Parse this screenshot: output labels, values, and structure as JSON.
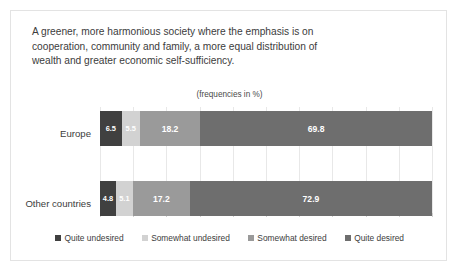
{
  "card": {
    "title_lines": [
      "A greener, more harmonious society where the emphasis is on",
      "cooperation, community and family, a more equal distribution of",
      "wealth and greater economic self-sufficiency."
    ],
    "subtitle": "(frequencies in %)"
  },
  "chart_data": {
    "type": "bar",
    "orientation": "horizontal",
    "stacked": true,
    "normalized": true,
    "title": "A greener, more harmonious society where the emphasis is on cooperation, community and family, a more equal distribution of wealth and greater economic self-sufficiency.",
    "subtitle": "(frequencies in %)",
    "xlabel": "",
    "ylabel": "",
    "xlim": [
      0,
      100
    ],
    "grid": true,
    "legend_position": "bottom",
    "categories": [
      "Europe",
      "Other countries"
    ],
    "series": [
      {
        "name": "Quite undesired",
        "color": "#404040",
        "values": [
          6.5,
          4.8
        ]
      },
      {
        "name": "Somewhat undesired",
        "color": "#d2d2d2",
        "values": [
          5.5,
          5.1
        ]
      },
      {
        "name": "Somewhat desired",
        "color": "#9a9a9a",
        "values": [
          18.2,
          17.2
        ]
      },
      {
        "name": "Quite desired",
        "color": "#6e6e6e",
        "values": [
          69.8,
          72.9
        ]
      }
    ],
    "value_labels": [
      [
        "6.5",
        "5.5",
        "18.2",
        "69.8"
      ],
      [
        "4.8",
        "5.1",
        "17.2",
        "72.9"
      ]
    ],
    "gridline_values": [
      0,
      10,
      20,
      30,
      40,
      50,
      60,
      70,
      80,
      90,
      100
    ]
  },
  "colors": {
    "card_border": "#e3e3e3",
    "background": "#ffffff",
    "text": "#3c3c3c",
    "gridline": "#e8e8e8",
    "value_label": "#ffffff"
  }
}
